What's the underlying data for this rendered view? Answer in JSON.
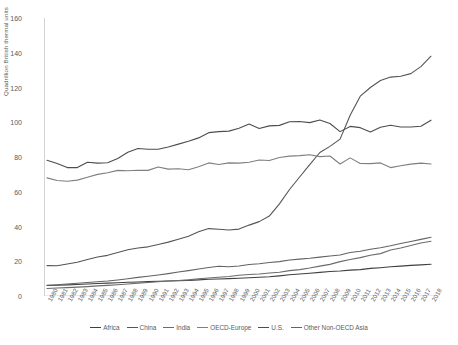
{
  "chart_data": {
    "type": "line",
    "title": "",
    "xlabel": "",
    "ylabel": "Quadrillion British thermal units",
    "ylim": [
      0,
      160
    ],
    "yticks": [
      0,
      20,
      40,
      60,
      80,
      100,
      120,
      140,
      160
    ],
    "grid": false,
    "legend_position": "bottom",
    "categories": [
      "1980",
      "1981",
      "1982",
      "1983",
      "1984",
      "1985",
      "1986",
      "1987",
      "1988",
      "1989",
      "1990",
      "1991",
      "1992",
      "1993",
      "1994",
      "1995",
      "1996",
      "1997",
      "1998",
      "1999",
      "2000",
      "2001",
      "2002",
      "2003",
      "2004",
      "2005",
      "2006",
      "2007",
      "2008",
      "2009",
      "2010",
      "2011",
      "2012",
      "2013",
      "2014",
      "2015",
      "2016",
      "2017",
      "2018"
    ],
    "series": [
      {
        "name": "Africa",
        "color": "#404040",
        "values": [
          6.0,
          6.2,
          6.4,
          6.6,
          6.9,
          7.2,
          7.4,
          7.6,
          7.9,
          8.1,
          8.3,
          8.5,
          8.6,
          8.8,
          9.0,
          9.3,
          9.6,
          9.8,
          10.0,
          10.2,
          10.5,
          10.8,
          11.1,
          11.6,
          12.2,
          12.7,
          13.1,
          13.6,
          14.1,
          14.4,
          14.9,
          15.2,
          15.9,
          16.3,
          16.8,
          17.2,
          17.6,
          17.9,
          18.3
        ]
      },
      {
        "name": "China",
        "color": "#555555",
        "values": [
          17.5,
          17.4,
          18.4,
          19.4,
          21.0,
          22.4,
          23.4,
          25.0,
          26.6,
          27.6,
          28.3,
          29.6,
          31.0,
          32.7,
          34.4,
          37.0,
          38.8,
          38.4,
          38.0,
          38.5,
          40.8,
          42.8,
          46.0,
          53.0,
          61.3,
          68.5,
          75.6,
          82.6,
          86.1,
          90.3,
          104.0,
          115.0,
          120.0,
          124.0,
          126.0,
          126.5,
          128.0,
          132.0,
          138.0
        ]
      },
      {
        "name": "India",
        "color": "#6b6b6b",
        "values": [
          4.3,
          4.6,
          4.8,
          5.1,
          5.4,
          5.8,
          6.1,
          6.5,
          6.9,
          7.4,
          7.8,
          8.2,
          8.6,
          8.9,
          9.3,
          9.9,
          10.4,
          10.8,
          11.2,
          11.9,
          12.4,
          12.7,
          13.2,
          13.7,
          14.6,
          15.2,
          16.1,
          17.2,
          18.2,
          19.8,
          21.0,
          22.1,
          23.5,
          24.4,
          26.5,
          27.6,
          29.1,
          30.5,
          31.5
        ]
      },
      {
        "name": "OECD-Europe",
        "color": "#7f7f7f",
        "values": [
          68.0,
          66.5,
          66.0,
          66.7,
          68.3,
          70.0,
          70.9,
          72.3,
          72.1,
          72.4,
          72.3,
          74.2,
          73.0,
          73.2,
          72.7,
          74.4,
          76.6,
          75.7,
          76.6,
          76.5,
          77.0,
          78.3,
          78.0,
          79.7,
          80.5,
          80.8,
          81.3,
          80.2,
          80.6,
          76.0,
          79.5,
          76.3,
          76.2,
          76.6,
          73.9,
          75.0,
          75.9,
          76.5,
          76.0
        ]
      },
      {
        "name": "U.S.",
        "color": "#4d4d4d",
        "values": [
          78.1,
          76.2,
          73.9,
          73.9,
          77.0,
          76.5,
          76.7,
          79.1,
          82.7,
          84.9,
          84.5,
          84.5,
          85.8,
          87.4,
          89.1,
          91.0,
          94.0,
          94.6,
          94.9,
          96.6,
          99.0,
          96.4,
          97.9,
          98.2,
          100.3,
          100.4,
          99.8,
          101.3,
          99.3,
          94.6,
          97.6,
          96.9,
          94.4,
          97.1,
          98.3,
          97.3,
          97.3,
          97.7,
          101.2
        ]
      },
      {
        "name": "Other Non-OECD Asia",
        "color": "#636363",
        "values": [
          6.2,
          6.5,
          6.9,
          7.3,
          7.8,
          8.2,
          8.6,
          9.2,
          9.9,
          10.7,
          11.4,
          12.1,
          12.9,
          13.8,
          14.6,
          15.5,
          16.4,
          17.1,
          16.8,
          17.3,
          18.1,
          18.6,
          19.3,
          19.8,
          20.7,
          21.2,
          21.7,
          22.4,
          23.0,
          23.6,
          25.0,
          25.8,
          26.9,
          27.8,
          28.9,
          30.2,
          31.4,
          32.6,
          33.8
        ]
      }
    ]
  },
  "legend": {
    "items": [
      {
        "label": "Africa"
      },
      {
        "label": "China"
      },
      {
        "label": "India"
      },
      {
        "label": "OECD-Europe"
      },
      {
        "label": "U.S."
      },
      {
        "label": "Other Non-OECD Asia"
      }
    ]
  }
}
